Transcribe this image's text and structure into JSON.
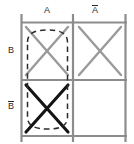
{
  "diagram": {
    "type": "karnaugh-map",
    "title": "",
    "colors": {
      "grid_line": "#8c8c8c",
      "cell_mark_inactive": "#9a9a9a",
      "cell_mark_active": "#141414",
      "group_outline": "#2b2b2b",
      "label_text": "#2b2b2b",
      "background": "#ffffff"
    },
    "column_headers": [
      {
        "id": "A",
        "label": "A",
        "overbar": false
      },
      {
        "id": "notA",
        "label": "A",
        "overbar": true
      }
    ],
    "row_headers": [
      {
        "id": "B",
        "label": "B",
        "overbar": false
      },
      {
        "id": "notB",
        "label": "B",
        "overbar": true
      }
    ],
    "cells": [
      {
        "row": "B",
        "col": "A",
        "mark": "X",
        "state": "inactive",
        "grouped": true
      },
      {
        "row": "B",
        "col": "notA",
        "mark": "X",
        "state": "inactive",
        "grouped": false
      },
      {
        "row": "notB",
        "col": "A",
        "mark": "X",
        "state": "active",
        "grouped": true
      },
      {
        "row": "notB",
        "col": "notA",
        "mark": "",
        "state": "empty",
        "grouped": false
      }
    ],
    "groups": [
      {
        "id": "group-a",
        "shape": "dashed-oval",
        "spans": [
          "B/A",
          "notB/A"
        ],
        "style": "dashed"
      }
    ],
    "geometry": {
      "grid_left": 21,
      "grid_right": 124,
      "grid_top": 22,
      "grid_bottom": 136,
      "grid_mid_x": 73,
      "grid_mid_y": 80,
      "oval_left": 27,
      "oval_right": 68,
      "oval_top": 30,
      "oval_bottom": 129
    }
  }
}
